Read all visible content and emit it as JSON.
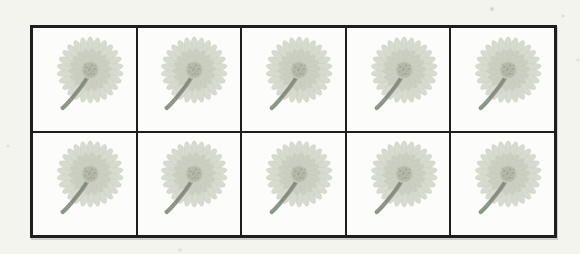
{
  "figure": {
    "kind": "scanned worksheet table of flowers",
    "rows": 2,
    "columns": 5,
    "total_flowers": 10,
    "item": "daisy-flower"
  },
  "colors": {
    "page_background": "#f4f4ef",
    "cell_background": "#fcfcfa",
    "grid_line": "#1e1e1e",
    "petal": "#d7dacf",
    "petal_inner": "#cbcfc1",
    "petal_edge": "#b9beaf",
    "flower_center": "#b4b9a9",
    "flower_center_dot": "#98a08e",
    "stem": "#8e968b",
    "stem_shadow": "#767e6e"
  },
  "flower": {
    "outer_petal_count": 26,
    "inner_petal_count": 18
  }
}
